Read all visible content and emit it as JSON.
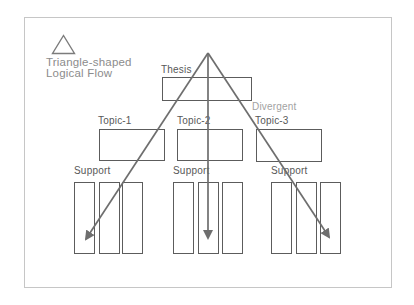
{
  "title": {
    "line1": "Triangle-shaped",
    "line2": "Logical Flow"
  },
  "icons": {
    "triangle": "triangle-outline-icon"
  },
  "diagram": {
    "thesis": {
      "label": "Thesis"
    },
    "divergent_label": "Divergent",
    "topics": [
      {
        "label": "Topic-1"
      },
      {
        "label": "Topic-2"
      },
      {
        "label": "Topic-3"
      }
    ],
    "support_groups": [
      {
        "label": "Support",
        "columns": 3
      },
      {
        "label": "Support",
        "columns": 3
      },
      {
        "label": "Support",
        "columns": 3
      }
    ],
    "arrows": {
      "count": 3,
      "origin": "thesis-apex",
      "style": "divergent"
    }
  },
  "colors": {
    "background": "#ffffff",
    "frame_border": "#c6c6c6",
    "box_border": "#5c5c5c",
    "arrow": "#6e6e6e",
    "title_text": "#8c8c8c",
    "label_text": "#585858",
    "divergent_text": "#a2a2a2"
  }
}
